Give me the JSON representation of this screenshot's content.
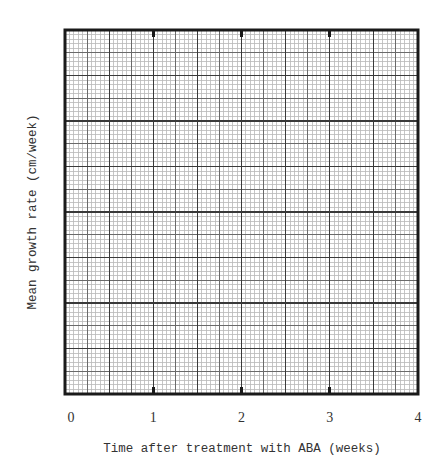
{
  "chart_data": {
    "type": "line",
    "title": "",
    "xlabel": "Time after treatment with ABA (weeks)",
    "ylabel": "Mean growth rate (cm/week)",
    "x_ticks": [
      "0",
      "1",
      "2",
      "3",
      "4"
    ],
    "xlim": [
      0,
      4
    ],
    "y_ticks": [],
    "ylim": null,
    "grid": true,
    "grid_style": "graph paper: 8x8 major squares, each subdivided 10x10 minor, darker mid-line every 5 minor",
    "series": [],
    "legend": null,
    "note": "Blank graph paper axes for plotting; no data points drawn"
  },
  "layout": {
    "frame": {
      "x0": 65,
      "y0": 30,
      "x1": 418,
      "y1": 394
    },
    "major_x_divisions": 8,
    "major_y_divisions": 8,
    "minor_per_major": 10,
    "tick_length": 7,
    "colors": {
      "frame": "#1a1a1a",
      "major": "#3a3a3a",
      "mid": "#6a6a6a",
      "minor": "#b8b8b8",
      "background": "#ffffff"
    }
  }
}
